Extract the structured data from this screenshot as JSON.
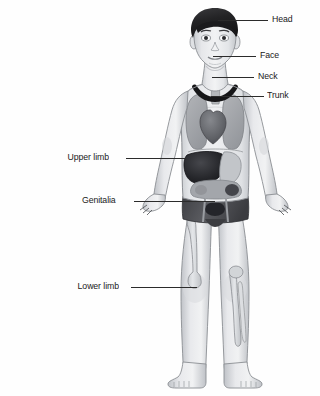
{
  "diagram": {
    "background_color": "#fefefe",
    "line_color": "#2b2b2b",
    "text_color": "#1a1a1a"
  },
  "callouts": [
    {
      "id": "head",
      "label": "Head",
      "side": "right",
      "text_x": 272,
      "text_y": 14,
      "line_x": 218,
      "line_y": 20,
      "line_width": 50
    },
    {
      "id": "face",
      "label": "Face",
      "side": "right",
      "text_x": 260,
      "text_y": 50,
      "line_x": 213,
      "line_y": 56,
      "line_width": 43
    },
    {
      "id": "neck",
      "label": "Neck",
      "side": "right",
      "text_x": 258,
      "text_y": 71,
      "line_x": 212,
      "line_y": 77,
      "line_width": 42
    },
    {
      "id": "trunk",
      "label": "Trunk",
      "side": "right",
      "text_x": 267,
      "text_y": 90,
      "line_x": 211,
      "line_y": 96,
      "line_width": 53
    },
    {
      "id": "upper-limb",
      "label": "Upper limb",
      "side": "left",
      "text_x": 64,
      "text_y": 152,
      "line_x": 126,
      "line_y": 158,
      "line_width": 60
    },
    {
      "id": "genitalia",
      "label": "Genitalia",
      "side": "left",
      "text_x": 79,
      "text_y": 195,
      "line_x": 134,
      "line_y": 201,
      "line_width": 81
    },
    {
      "id": "lower-limb",
      "label": "Lower limb",
      "side": "left",
      "text_x": 74,
      "text_y": 281,
      "line_x": 131,
      "line_y": 287,
      "line_width": 66
    }
  ],
  "figure": {
    "skin_color": "#e9eaec",
    "skin_shadow": "#c6c9cd",
    "hair_color": "#2a2a2c",
    "collar_color": "#1d1d1f",
    "shorts_color": "#4f5055",
    "lung_color": "#a6a8ac",
    "heart_color": "#6e7075",
    "liver_color": "#2d2e32",
    "stomach_color": "#b9bcc0",
    "intestine_color": "#9b9ea3",
    "bone_color": "#d8dade",
    "outline_color": "#7a7d82",
    "parts": [
      "head",
      "hair",
      "face",
      "eyes",
      "nose",
      "mouth",
      "ears",
      "neck",
      "collar",
      "trunk",
      "left-arm",
      "right-arm",
      "left-hand",
      "right-hand",
      "shorts",
      "left-leg",
      "right-leg",
      "left-foot",
      "right-foot",
      "lungs",
      "heart",
      "liver",
      "stomach",
      "intestines",
      "femur",
      "tibia",
      "fibula"
    ]
  }
}
